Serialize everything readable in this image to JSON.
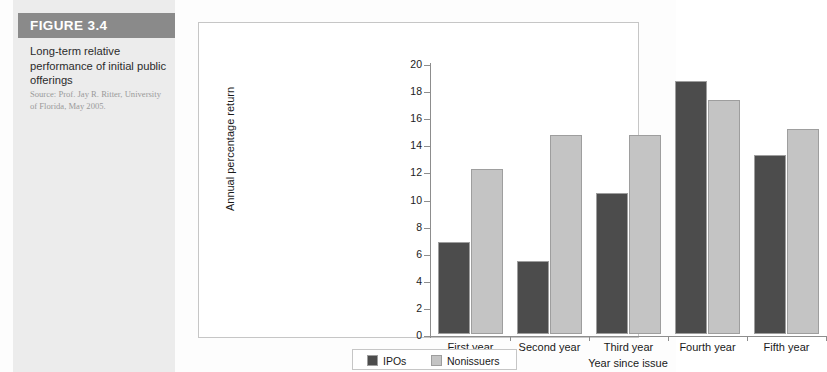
{
  "figure": {
    "band_label": "FIGURE 3.4",
    "title": "Long-term relative performance of initial public offerings",
    "source": "Source: Prof. Jay R. Ritter, University of Florida, May 2005."
  },
  "legend": {
    "position": "bottom",
    "items": [
      {
        "label": "IPOs",
        "color": "#4c4c4c"
      },
      {
        "label": "Nonissuers",
        "color": "#c4c4c4"
      }
    ]
  },
  "colors": {
    "ipos": "#4c4c4c",
    "nonissuers": "#c4c4c4",
    "band": "#8a8a8a",
    "caption_bg": "#ececec",
    "axis": "#8d8d8d"
  },
  "chart_data": {
    "type": "bar",
    "title": "",
    "xlabel": "Year since issue",
    "ylabel": "Annual percentage return",
    "categories": [
      "First year",
      "Second year",
      "Third year",
      "Fourth year",
      "Fifth year"
    ],
    "series": [
      {
        "name": "IPOs",
        "values": [
          6.8,
          5.4,
          10.4,
          18.7,
          13.2
        ]
      },
      {
        "name": "Nonissuers",
        "values": [
          12.2,
          14.7,
          14.7,
          17.3,
          15.1
        ]
      }
    ],
    "ylim": [
      0,
      20
    ],
    "yticks": [
      0,
      2,
      4,
      6,
      8,
      10,
      12,
      14,
      16,
      18,
      20
    ],
    "ytick_labels": [
      "0",
      "2",
      "4",
      "6",
      "8",
      "10",
      "12",
      "14",
      "16",
      "18",
      "20"
    ],
    "grid": false,
    "legend_position": "bottom"
  }
}
